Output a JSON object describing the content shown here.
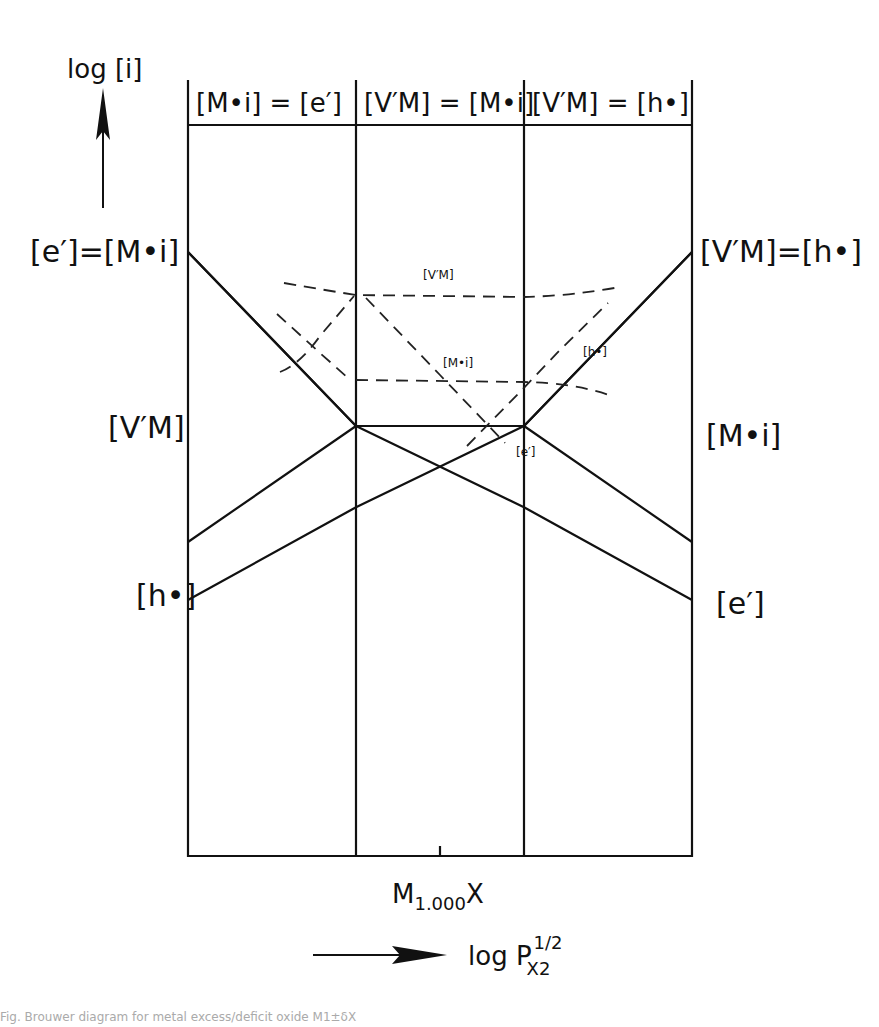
{
  "figure": {
    "type": "brouwer-diagram",
    "y_axis": {
      "label": "log [i]",
      "direction": "up"
    },
    "x_axis": {
      "label": "log P",
      "label_superscript": "1/2",
      "label_subscript": "X2",
      "direction": "right"
    },
    "center_marker": {
      "label": "M",
      "subscript": "1.000",
      "suffix": "X"
    },
    "regions": [
      {
        "id": "region-1",
        "condition_left": "[M•i]",
        "condition_right": "[e′]"
      },
      {
        "id": "region-2",
        "condition_left": "[V′M]",
        "condition_right": "[M•i]"
      },
      {
        "id": "region-3",
        "condition_left": "[V′M]",
        "condition_right": "[h•]"
      }
    ],
    "left_labels": [
      {
        "id": "e-equals-Mi",
        "text": "[e′]=[M•i]"
      },
      {
        "id": "VM",
        "text": "[V′M]"
      },
      {
        "id": "h",
        "text": "[h•]"
      }
    ],
    "right_labels": [
      {
        "id": "VM-equals-h",
        "text": "[V′M]=[h•]"
      },
      {
        "id": "Mi",
        "text": "[M•i]"
      },
      {
        "id": "e",
        "text": "[e′]"
      }
    ],
    "inner_labels": [
      {
        "id": "VM-dashed",
        "text": "[V′M]"
      },
      {
        "id": "Mi-dashed",
        "text": "[M•i]"
      },
      {
        "id": "h-dashed",
        "text": "[h•]"
      },
      {
        "id": "e-dashed",
        "text": "[e′]"
      }
    ],
    "species": [
      {
        "name": "e′",
        "relative_log_values": [
          6,
          3,
          1.6,
          0
        ]
      },
      {
        "name": "M•i",
        "relative_log_values": [
          6,
          3,
          3,
          1
        ]
      },
      {
        "name": "V′M",
        "relative_log_values": [
          1,
          3,
          3,
          6
        ]
      },
      {
        "name": "h•",
        "relative_log_values": [
          0,
          1.6,
          3,
          6
        ]
      }
    ],
    "breakpoints_x": [
      "left-edge",
      "boundary-1-2",
      "boundary-2-3",
      "right-edge"
    ]
  },
  "caption": "Fig. Brouwer diagram for metal excess/deficit oxide M1±δX"
}
